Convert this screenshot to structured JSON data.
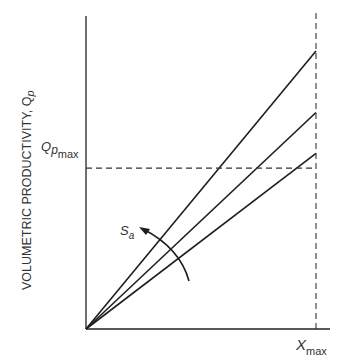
{
  "chart_data": {
    "type": "line",
    "title": "",
    "xlabel": "",
    "ylabel": "VOLUMETRIC PRODUCTIVITY, Q",
    "ylabel_subscript": "p",
    "grid": false,
    "xlim": [
      0,
      1
    ],
    "ylim": [
      0,
      1.07
    ],
    "series": [
      {
        "name": "line-1",
        "x": [
          0,
          1
        ],
        "y": [
          0,
          0.95
        ]
      },
      {
        "name": "line-2",
        "x": [
          0,
          1
        ],
        "y": [
          0,
          0.74
        ]
      },
      {
        "name": "line-3",
        "x": [
          0,
          1
        ],
        "y": [
          0,
          0.6
        ]
      }
    ],
    "reference_lines": [
      {
        "orientation": "horizontal",
        "value": 0.55,
        "label": "Q",
        "label_sub": "p",
        "label_sub2": "max",
        "style": "dashed"
      },
      {
        "orientation": "vertical",
        "value": 1.0,
        "label": "X",
        "label_sub": "max",
        "style": "dashed"
      }
    ],
    "annotations": [
      {
        "text": "S",
        "subscript": "a",
        "type": "curved-arrow",
        "meaning": "direction of increasing S_a"
      }
    ]
  }
}
